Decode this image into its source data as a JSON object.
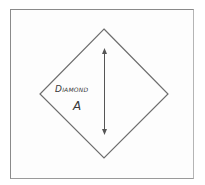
{
  "diagram": {
    "title": "Diamond",
    "letter": "A",
    "shape": "diamond",
    "dimension_arrow": "vertical double-headed arrow",
    "colors": {
      "stroke": "#6e6e6e",
      "frame": "#8a8a8a",
      "text": "#3a3a3a",
      "background": "#ffffff"
    }
  }
}
